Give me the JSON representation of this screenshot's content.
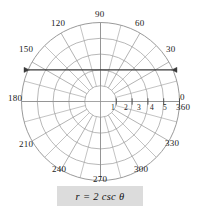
{
  "figure": {
    "title": "",
    "equation_label": "r = 2 csc θ"
  },
  "angle_labels": [
    {
      "text": "0",
      "deg": 0,
      "x": 180,
      "y": 93
    },
    {
      "text": "360",
      "deg": 0,
      "x": 176,
      "y": 103
    },
    {
      "text": "30",
      "deg": 30,
      "x": 166,
      "y": 45
    },
    {
      "text": "60",
      "deg": 60,
      "x": 135,
      "y": 19
    },
    {
      "text": "90",
      "deg": 90,
      "x": 95,
      "y": 10
    },
    {
      "text": "120",
      "deg": 120,
      "x": 51,
      "y": 19
    },
    {
      "text": "150",
      "deg": 150,
      "x": 19,
      "y": 45
    },
    {
      "text": "180",
      "deg": 180,
      "x": 8,
      "y": 94
    },
    {
      "text": "210",
      "deg": 210,
      "x": 19,
      "y": 140
    },
    {
      "text": "240",
      "deg": 240,
      "x": 52,
      "y": 165
    },
    {
      "text": "270",
      "deg": 270,
      "x": 93,
      "y": 175
    },
    {
      "text": "300",
      "deg": 300,
      "x": 134,
      "y": 165
    },
    {
      "text": "330",
      "deg": 330,
      "x": 165,
      "y": 139
    }
  ],
  "radial_labels": [
    {
      "text": "1",
      "r": 1,
      "x": 111,
      "y": 104
    },
    {
      "text": "2",
      "r": 2,
      "x": 124,
      "y": 104
    },
    {
      "text": "3",
      "r": 3,
      "x": 137,
      "y": 104
    },
    {
      "text": "4",
      "r": 4,
      "x": 150,
      "y": 104
    },
    {
      "text": "5",
      "r": 5,
      "x": 163,
      "y": 104
    }
  ],
  "colors": {
    "grid": "#9a9a9a",
    "axis": "#8d8d8d",
    "curve": "#3a3a3a",
    "text": "#1a1a1a",
    "formula_bg": "#dcdcdc",
    "background": "#ffffff"
  },
  "chart_data": {
    "type": "line",
    "coordinate_system": "polar",
    "title": "",
    "equation": "r = 2 csc θ",
    "rlim": [
      0,
      5
    ],
    "r_ticks": [
      1,
      2,
      3,
      4,
      5
    ],
    "theta_ticks_deg": [
      0,
      30,
      60,
      90,
      120,
      150,
      180,
      210,
      240,
      270,
      300,
      330,
      360
    ],
    "theta_grid_step_deg": 15,
    "grid": true,
    "legend": false,
    "cartesian_equivalent": "y = 2",
    "series": [
      {
        "name": "r = 2 csc θ",
        "theta_deg": [
          24,
          30,
          45,
          60,
          90,
          120,
          135,
          150,
          156
        ],
        "r": [
          4.92,
          4.0,
          2.83,
          2.31,
          2.0,
          2.31,
          2.83,
          4.0,
          4.92
        ],
        "arrow_start": true,
        "arrow_end": true
      }
    ]
  }
}
